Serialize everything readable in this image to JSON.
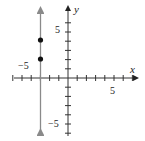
{
  "chart_data": {
    "type": "scatter",
    "title": "",
    "xlabel": "x",
    "ylabel": "y",
    "xlim": [
      -7,
      7
    ],
    "ylim": [
      -6,
      6
    ],
    "grid": false,
    "tick_labels": {
      "x": [
        "-5",
        "5"
      ],
      "y": [
        "5",
        "-5"
      ]
    },
    "series": [
      {
        "name": "points",
        "type": "scatter",
        "x": [
          -3,
          -3
        ],
        "y": [
          4,
          2
        ],
        "color": "#111111"
      },
      {
        "name": "line x = -3",
        "type": "line",
        "x": [
          -3,
          -3
        ],
        "y": [
          -6,
          6
        ],
        "color": "#8a8a8a"
      }
    ]
  },
  "labels": {
    "x_axis": "x",
    "y_axis": "y",
    "x_neg5": "−5",
    "x_pos5": "5",
    "y_pos5": "5",
    "y_neg5": "−5"
  },
  "colors": {
    "axis": "#333333",
    "line": "#8a8a8a",
    "point": "#111111"
  }
}
